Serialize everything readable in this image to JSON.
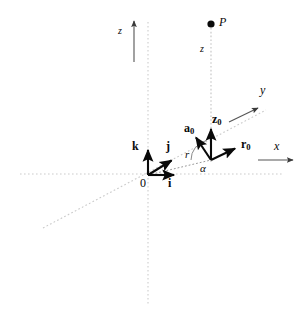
{
  "figure": {
    "width": 306,
    "height": 320,
    "background_color": "#ffffff",
    "ink_color": "#0a0a0a",
    "guide_color": "#c9c9c9",
    "axis_line_color": "#555555"
  },
  "labels": {
    "point_p": "P",
    "axis_z_top": "z",
    "height_z": "z",
    "axis_y": "y",
    "axis_x": "x",
    "origin": "0",
    "unit_i_base": "i",
    "unit_j_base": "j",
    "unit_k_base": "k",
    "unit_r_base": "r",
    "unit_r_sub": "0",
    "unit_a_base": "a",
    "unit_a_sub": "0",
    "unit_z_base": "z",
    "unit_z_sub": "0",
    "radius_r": "r",
    "angle_alpha": "α"
  },
  "geometry": {
    "origin": {
      "x": 148,
      "y": 175
    },
    "foot_point": {
      "x": 211,
      "y": 160
    },
    "point_p": {
      "x": 211,
      "y": 24,
      "dot_radius": 3.6
    },
    "vertical_guide_x": 148,
    "vertical_guide_y1": 22,
    "vertical_guide_y2": 305,
    "horizontal_guide_y": 174,
    "horizontal_guide_x1": 20,
    "horizontal_guide_x2": 282,
    "p_guide_x": 211,
    "p_guide_y1": 28,
    "p_guide_y2": 162,
    "diagonal_guide": {
      "x1": 43,
      "y1": 228,
      "x2": 266,
      "y2": 110
    },
    "z_axis_arrow": {
      "x": 134,
      "y1": 62,
      "y2": 20
    },
    "y_axis_arrow": {
      "x1": 229,
      "y1": 122,
      "x2": 259,
      "y2": 107
    },
    "x_axis_arrow": {
      "x1": 258,
      "y1": 160,
      "x2": 294,
      "y2": 160
    },
    "vector_i": {
      "x1": 148,
      "y1": 175,
      "x2": 176,
      "y2": 175
    },
    "vector_j": {
      "x1": 148,
      "y1": 175,
      "x2": 173,
      "y2": 159
    },
    "vector_k": {
      "x1": 148,
      "y1": 175,
      "x2": 148,
      "y2": 148
    },
    "vector_r0": {
      "x1": 211,
      "y1": 160,
      "x2": 238,
      "y2": 147
    },
    "vector_a0": {
      "x1": 211,
      "y1": 160,
      "x2": 194,
      "y2": 135
    },
    "vector_z0": {
      "x1": 211,
      "y1": 160,
      "x2": 211,
      "y2": 127
    },
    "radius_segment": {
      "x1": 148,
      "y1": 175,
      "x2": 211,
      "y2": 160
    },
    "angle_arc": {
      "center_x": 211,
      "center_y": 160,
      "radius": 20,
      "start_deg": 180,
      "end_deg": 104
    }
  },
  "label_positions": {
    "point_p": {
      "left": 219,
      "top": 17,
      "size": 11
    },
    "axis_z_top": {
      "left": 118,
      "top": 27,
      "size": 10
    },
    "height_z": {
      "left": 200,
      "top": 45,
      "size": 10
    },
    "axis_y": {
      "left": 261,
      "top": 85,
      "size": 11
    },
    "axis_x": {
      "left": 274,
      "top": 141,
      "size": 11
    },
    "origin": {
      "left": 140,
      "top": 178,
      "size": 11
    },
    "unit_i": {
      "left": 168,
      "top": 178,
      "size": 11
    },
    "unit_j": {
      "left": 166,
      "top": 141,
      "size": 11
    },
    "unit_k": {
      "left": 133,
      "top": 141,
      "size": 11
    },
    "unit_r0": {
      "left": 242,
      "top": 139,
      "size": 11
    },
    "unit_a0": {
      "left": 185,
      "top": 123,
      "size": 11
    },
    "unit_z0": {
      "left": 213,
      "top": 114,
      "size": 11
    },
    "radius_r": {
      "left": 185,
      "top": 150,
      "size": 10
    },
    "angle_alpha": {
      "left": 201,
      "top": 164,
      "size": 10
    }
  }
}
